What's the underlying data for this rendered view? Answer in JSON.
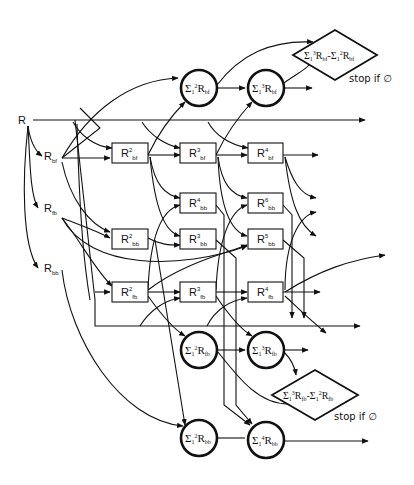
{
  "diagram": {
    "root": {
      "label": "R"
    },
    "inputs": [
      {
        "id": "R_bf",
        "main": "R",
        "sub": "bf"
      },
      {
        "id": "R_fb",
        "main": "R",
        "sub": "fb"
      },
      {
        "id": "R_bb",
        "main": "R",
        "sub": "bb"
      }
    ],
    "boxes": [
      {
        "id": "R2_bf",
        "main": "R",
        "sup": "2",
        "sub": "bf"
      },
      {
        "id": "R3_bf",
        "main": "R",
        "sup": "3",
        "sub": "bf"
      },
      {
        "id": "R4_bf",
        "main": "R",
        "sup": "4",
        "sub": "bf"
      },
      {
        "id": "R4_bb",
        "main": "R",
        "sup": "4",
        "sub": "bb"
      },
      {
        "id": "R6_bb",
        "main": "R",
        "sup": "6",
        "sub": "bb"
      },
      {
        "id": "R2_bb",
        "main": "R",
        "sup": "2",
        "sub": "bb"
      },
      {
        "id": "R3_bb",
        "main": "R",
        "sup": "3",
        "sub": "bb"
      },
      {
        "id": "R5_bb",
        "main": "R",
        "sup": "5",
        "sub": "bb"
      },
      {
        "id": "R2_fb",
        "main": "R",
        "sup": "2",
        "sub": "fb"
      },
      {
        "id": "R3_fb",
        "main": "R",
        "sup": "3",
        "sub": "fb"
      },
      {
        "id": "R4_fb",
        "main": "R",
        "sup": "4",
        "sub": "fb"
      }
    ],
    "circles": [
      {
        "id": "sum2_bf",
        "sigma": "Σ",
        "lower": "1",
        "sup": "2",
        "main": "R",
        "sub": "bf"
      },
      {
        "id": "sum3_bf",
        "sigma": "Σ",
        "lower": "1",
        "sup": "3",
        "main": "R",
        "sub": "bf"
      },
      {
        "id": "sum2_fb",
        "sigma": "Σ",
        "lower": "1",
        "sup": "2",
        "main": "R",
        "sub": "fb"
      },
      {
        "id": "sum3_fb",
        "sigma": "Σ",
        "lower": "1",
        "sup": "3",
        "main": "R",
        "sub": "fb"
      },
      {
        "id": "sum2_bb",
        "sigma": "Σ",
        "lower": "1",
        "sup": "2",
        "main": "R",
        "sub": "bb"
      },
      {
        "id": "sum4_bb",
        "sigma": "Σ",
        "lower": "1",
        "sup": "4",
        "main": "R",
        "sub": "bb"
      }
    ],
    "diamonds": [
      {
        "id": "diff_bf",
        "text_a": "Σ",
        "lower_a": "1",
        "sup_a": "3",
        "main_a": "R",
        "sub_a": "bf",
        "minus": "-",
        "text_b": "Σ",
        "lower_b": "1",
        "sup_b": "2",
        "main_b": "R",
        "sub_b": "bf",
        "stop_label": "stop if ∅"
      },
      {
        "id": "diff_fb",
        "text_a": "Σ",
        "lower_a": "1",
        "sup_a": "3",
        "main_a": "R",
        "sub_a": "fb",
        "minus": "-",
        "text_b": "Σ",
        "lower_b": "1",
        "sup_b": "2",
        "main_b": "R",
        "sub_b": "fb",
        "stop_label": "stop if ∅"
      }
    ]
  }
}
